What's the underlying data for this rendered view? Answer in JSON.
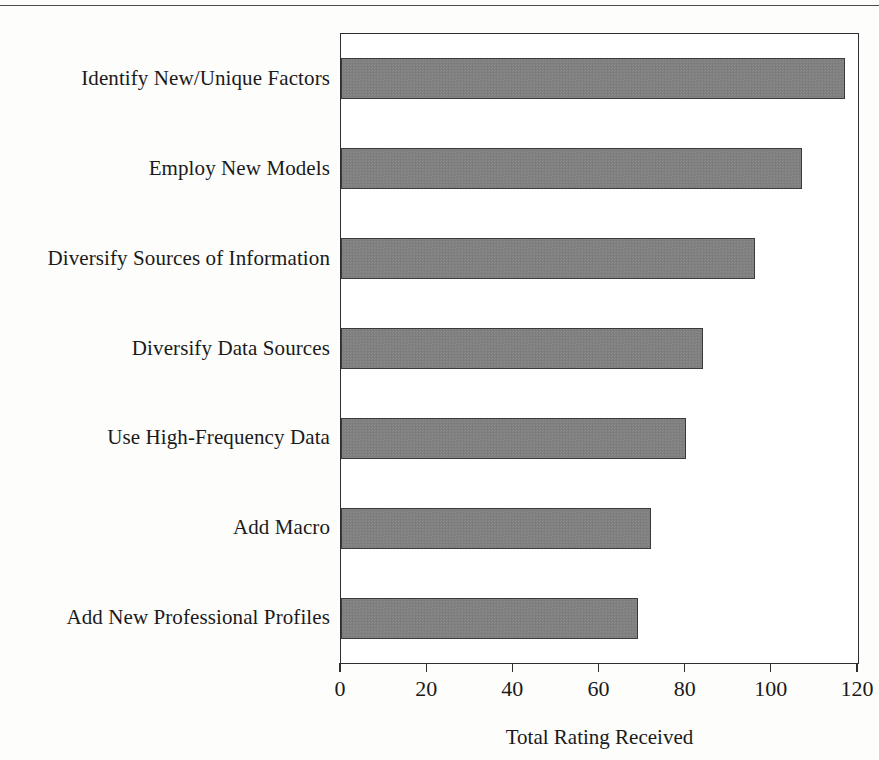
{
  "chart_data": {
    "type": "bar",
    "orientation": "horizontal",
    "title": "",
    "xlabel": "Total Rating Received",
    "ylabel": "",
    "xlim": [
      0,
      120
    ],
    "xticks": [
      0,
      20,
      40,
      60,
      80,
      100,
      120
    ],
    "grid": false,
    "legend": null,
    "categories": [
      "Identify New/Unique Factors",
      "Employ New Models",
      "Diversify Sources of Information",
      "Diversify Data Sources",
      "Use High-Frequency Data",
      "Add Macro",
      "Add New Professional Profiles"
    ],
    "values": [
      117,
      107,
      96,
      84,
      80,
      72,
      69
    ],
    "bar_fill_color": "#808080",
    "bar_edge_color": "#3a3a3a",
    "axis_color": "#2e2e2e",
    "background_color": "#ffffff"
  }
}
